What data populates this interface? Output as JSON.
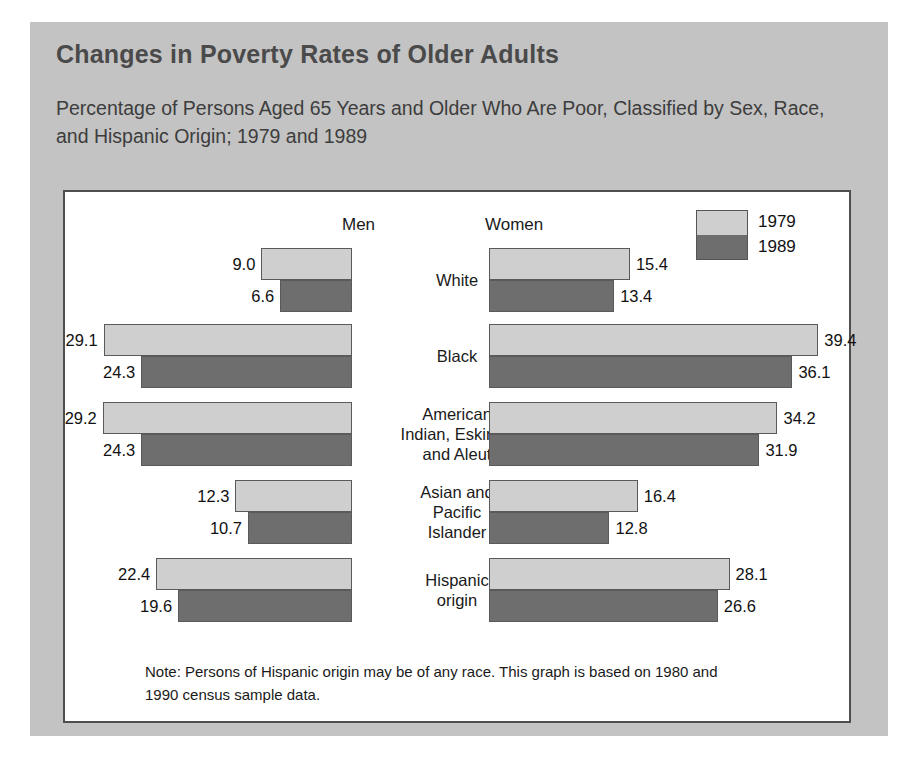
{
  "figure": {
    "title": "Changes in Poverty Rates of Older Adults",
    "subtitle": "Percentage of Persons Aged 65 Years and Older Who Are Poor, Classified by Sex, Race, and Hispanic Origin; 1979 and 1989",
    "note": "Note: Persons of Hispanic origin may be of any race. This graph is based on 1980 and 1990 census sample data."
  },
  "headers": {
    "men": "Men",
    "women": "Women"
  },
  "legend": {
    "items": [
      {
        "label": "1979",
        "color": "#cfcfcf"
      },
      {
        "label": "1989",
        "color": "#6e6e6e"
      }
    ]
  },
  "chart_data": {
    "type": "bar",
    "title": "Changes in Poverty Rates of Older Adults",
    "subtitle": "Percentage of Persons Aged 65 Years and Older Who Are Poor, Classified by Sex, Race, and Hispanic Origin; 1979 and 1989",
    "xlabel": "Percent poor",
    "ylabel": "",
    "orientation": "horizontal",
    "layout": "back-to-back (Men left, Women right)",
    "grid": false,
    "legend_position": "top-right",
    "categories": [
      "White",
      "Black",
      "American Indian, Eskimo, and Aleut",
      "Asian and Pacific Islander",
      "Hispanic origin"
    ],
    "panels": [
      {
        "name": "Men",
        "series": [
          {
            "name": "1979",
            "color": "#cfcfcf",
            "values": [
              9.0,
              29.1,
              29.2,
              12.3,
              22.4
            ]
          },
          {
            "name": "1989",
            "color": "#6e6e6e",
            "values": [
              6.6,
              24.3,
              24.3,
              10.7,
              19.6
            ]
          }
        ]
      },
      {
        "name": "Women",
        "series": [
          {
            "name": "1979",
            "color": "#cfcfcf",
            "values": [
              15.4,
              39.4,
              34.2,
              16.4,
              28.1
            ]
          },
          {
            "name": "1989",
            "color": "#6e6e6e",
            "values": [
              13.4,
              36.1,
              31.9,
              12.8,
              26.6
            ]
          }
        ]
      }
    ],
    "note": "Note: Persons of Hispanic origin may be of any race. This graph is based on 1980 and 1990 census sample data."
  },
  "groups": [
    {
      "label_lines": [
        "White"
      ],
      "men": {
        "y1979": "9.0",
        "y1989": "6.6"
      },
      "women": {
        "y1979": "15.4",
        "y1989": "13.4"
      }
    },
    {
      "label_lines": [
        "Black"
      ],
      "men": {
        "y1979": "29.1",
        "y1989": "24.3"
      },
      "women": {
        "y1979": "39.4",
        "y1989": "36.1"
      }
    },
    {
      "label_lines": [
        "American",
        "Indian, Eskimo,",
        "and Aleut"
      ],
      "men": {
        "y1979": "29.2",
        "y1989": "24.3"
      },
      "women": {
        "y1979": "34.2",
        "y1989": "31.9"
      }
    },
    {
      "label_lines": [
        "Asian and",
        "Pacific",
        "Islander"
      ],
      "men": {
        "y1979": "12.3",
        "y1989": "10.7"
      },
      "women": {
        "y1979": "16.4",
        "y1989": "12.8"
      }
    },
    {
      "label_lines": [
        "Hispanic",
        "origin"
      ],
      "men": {
        "y1979": "22.4",
        "y1989": "19.6"
      },
      "women": {
        "y1979": "28.1",
        "y1989": "26.6"
      }
    }
  ]
}
